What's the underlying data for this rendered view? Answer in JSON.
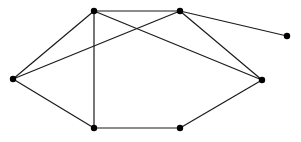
{
  "graph": {
    "width": 301,
    "height": 142,
    "node_color": "#000000",
    "edge_color": "#1a1a1a",
    "node_radius": 3.2,
    "nodes": [
      {
        "id": "A",
        "x": 94,
        "y": 11
      },
      {
        "id": "B",
        "x": 180,
        "y": 11
      },
      {
        "id": "C",
        "x": 287,
        "y": 36
      },
      {
        "id": "D",
        "x": 13,
        "y": 79
      },
      {
        "id": "E",
        "x": 262,
        "y": 80
      },
      {
        "id": "F",
        "x": 94,
        "y": 128
      },
      {
        "id": "G",
        "x": 180,
        "y": 128
      }
    ],
    "edges": [
      [
        "A",
        "B"
      ],
      [
        "A",
        "D"
      ],
      [
        "A",
        "F"
      ],
      [
        "A",
        "E"
      ],
      [
        "B",
        "D"
      ],
      [
        "B",
        "C"
      ],
      [
        "B",
        "E"
      ],
      [
        "D",
        "F"
      ],
      [
        "F",
        "G"
      ],
      [
        "G",
        "E"
      ]
    ]
  }
}
